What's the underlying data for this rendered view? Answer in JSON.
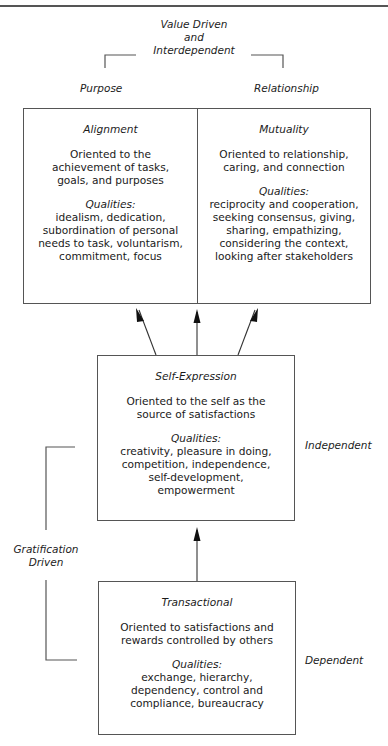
{
  "header": {
    "title_line1": "Value Driven",
    "title_line2": "and",
    "title_line3": "Interdependent",
    "left_label": "Purpose",
    "right_label": "Relationship"
  },
  "boxes": {
    "alignment": {
      "title": "Alignment",
      "description": "Oriented to the achievement of tasks, goals, and purposes",
      "qualities_label": "Qualities:",
      "qualities": "idealism, dedication, subordination of personal needs to task, voluntarism, commitment, focus"
    },
    "mutuality": {
      "title": "Mutuality",
      "description": "Oriented to relationship, caring, and connection",
      "qualities_label": "Qualities:",
      "qualities": "reciprocity and cooperation, seeking consensus, giving, sharing, empathizing, considering the context, looking after stakeholders"
    },
    "self_expression": {
      "title": "Self-Expression",
      "description": "Oriented to the self as the source of satisfactions",
      "qualities_label": "Qualities:",
      "qualities": "creativity, pleasure in doing, competition, independence, self-development, empowerment"
    },
    "transactional": {
      "title": "Transactional",
      "description": "Oriented to satisfactions and rewards controlled by others",
      "qualities_label": "Qualities:",
      "qualities": "exchange, hierarchy, dependency, control and compliance, bureaucracy"
    }
  },
  "side_labels": {
    "independent": "Independent",
    "dependent": "Dependent",
    "gratification_line1": "Gratification",
    "gratification_line2": "Driven"
  },
  "colors": {
    "line": "#555555",
    "text": "#1a1a1a"
  }
}
